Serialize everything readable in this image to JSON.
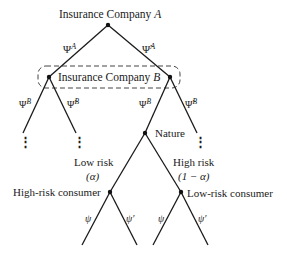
{
  "diagram": {
    "type": "game-tree",
    "nodes": {
      "root": {
        "label": "Insurance Company ",
        "var": "A"
      },
      "info_set": {
        "label": "Insurance Company ",
        "var": "B"
      },
      "nature": {
        "label": "Nature"
      },
      "high_risk_consumer": {
        "label": "High-risk consumer"
      },
      "low_risk_consumer": {
        "label": "Low-risk consumer"
      }
    },
    "edges": {
      "a_left": {
        "sym": "Ψ",
        "sup": "A"
      },
      "a_right": {
        "sym": "Ψ̃",
        "sup": "A"
      },
      "bl_left": {
        "sym": "Ψ",
        "sup": "B"
      },
      "bl_right": {
        "sym": "Ψ̃",
        "sup": "B"
      },
      "br_left": {
        "sym": "Ψ",
        "sup": "B"
      },
      "br_right": {
        "sym": "Ψ̃",
        "sup": "B"
      },
      "nature_left": {
        "line1": "Low risk",
        "line2": "(α)"
      },
      "nature_right": {
        "line1": "High risk",
        "line2": "(1 − α)"
      },
      "hr_left": "ψ",
      "hr_right": "ψ′",
      "lr_left": "ψ",
      "lr_right": "ψ′"
    },
    "ellipsis": "⋮"
  }
}
